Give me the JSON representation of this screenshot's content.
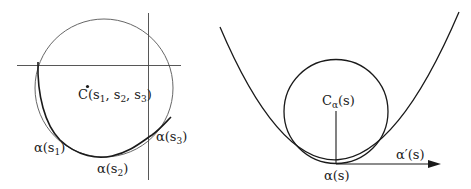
{
  "left_figure": {
    "center_label": {
      "base": "C(s",
      "s1": "1",
      "sep1": ", s",
      "s2": "2",
      "sep2": ", s",
      "s3": "3",
      "close": ")"
    },
    "points": [
      {
        "base": "α(s",
        "sub": "1",
        "close": ")"
      },
      {
        "base": "α(s",
        "sub": "2",
        "close": ")"
      },
      {
        "base": "α(s",
        "sub": "3",
        "close": ")"
      }
    ]
  },
  "right_figure": {
    "center_label": {
      "base": "C",
      "sub": "α",
      "arg": "(s)"
    },
    "point_label": "α(s)",
    "tangent_label": "α′(s)"
  },
  "colors": {
    "stroke": "#1a1a1a",
    "thin_stroke": "#555555",
    "background": "#ffffff"
  }
}
